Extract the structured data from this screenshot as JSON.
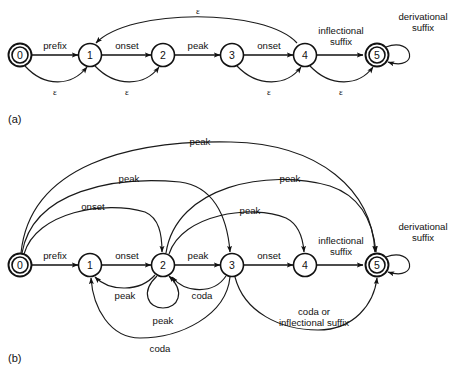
{
  "figure": {
    "type": "finite-state-automaton-diagram",
    "background_color": "#ffffff",
    "ink_color": "#111111",
    "panels": [
      {
        "id": "a",
        "caption": "(a)",
        "states": [
          {
            "id": "0",
            "label": "0",
            "accepting": true,
            "x": 20,
            "y": 55
          },
          {
            "id": "1",
            "label": "1",
            "accepting": false,
            "x": 90,
            "y": 55
          },
          {
            "id": "2",
            "label": "2",
            "accepting": false,
            "x": 163,
            "y": 55
          },
          {
            "id": "3",
            "label": "3",
            "accepting": false,
            "x": 232,
            "y": 55
          },
          {
            "id": "4",
            "label": "4",
            "accepting": false,
            "x": 305,
            "y": 55
          },
          {
            "id": "5",
            "label": "5",
            "accepting": true,
            "x": 377,
            "y": 55
          }
        ],
        "transitions": [
          {
            "from": "0",
            "to": "1",
            "label": "prefix",
            "label_x": 55,
            "label_y": 45
          },
          {
            "from": "1",
            "to": "2",
            "label": "onset",
            "label_x": 127,
            "label_y": 45
          },
          {
            "from": "2",
            "to": "3",
            "label": "peak",
            "label_x": 198,
            "label_y": 45
          },
          {
            "from": "3",
            "to": "4",
            "label": "onset",
            "label_x": 269,
            "label_y": 45
          },
          {
            "from": "4",
            "to": "5",
            "label": "inflectional suffix",
            "label_x": 341,
            "label_y": 36
          },
          {
            "from": "5",
            "to": "5",
            "label": "derivational suffix",
            "label_x": 421,
            "label_y": 22
          },
          {
            "from": "0",
            "to": "1",
            "label": "ε",
            "label_x": 55,
            "label_y": 90
          },
          {
            "from": "1",
            "to": "2",
            "label": "ε",
            "label_x": 127,
            "label_y": 90
          },
          {
            "from": "3",
            "to": "4",
            "label": "ε",
            "label_x": 269,
            "label_y": 90
          },
          {
            "from": "4",
            "to": "5",
            "label": "ε",
            "label_x": 341,
            "label_y": 90
          },
          {
            "from": "4",
            "to": "1",
            "label": "ε",
            "label_x": 198,
            "label_y": 11
          }
        ]
      },
      {
        "id": "b",
        "caption": "(b)",
        "states": [
          {
            "id": "0",
            "label": "0",
            "accepting": true,
            "x": 20,
            "y": 265
          },
          {
            "id": "1",
            "label": "1",
            "accepting": false,
            "x": 90,
            "y": 265
          },
          {
            "id": "2",
            "label": "2",
            "accepting": false,
            "x": 163,
            "y": 265
          },
          {
            "id": "3",
            "label": "3",
            "accepting": false,
            "x": 232,
            "y": 265
          },
          {
            "id": "4",
            "label": "4",
            "accepting": false,
            "x": 305,
            "y": 265
          },
          {
            "id": "5",
            "label": "5",
            "accepting": true,
            "x": 377,
            "y": 265
          }
        ],
        "transitions": [
          {
            "from": "0",
            "to": "1",
            "label": "prefix",
            "label_x": 55,
            "label_y": 255
          },
          {
            "from": "1",
            "to": "2",
            "label": "onset",
            "label_x": 127,
            "label_y": 255
          },
          {
            "from": "2",
            "to": "3",
            "label": "peak",
            "label_x": 198,
            "label_y": 255
          },
          {
            "from": "3",
            "to": "4",
            "label": "onset",
            "label_x": 269,
            "label_y": 255
          },
          {
            "from": "4",
            "to": "5",
            "label": "inflectional suffix",
            "label_x": 341,
            "label_y": 246
          },
          {
            "from": "5",
            "to": "5",
            "label": "derivational suffix",
            "label_x": 421,
            "label_y": 232
          },
          {
            "from": "0",
            "to": "2",
            "label": "onset",
            "label_x": 93,
            "label_y": 218
          },
          {
            "from": "0",
            "to": "3",
            "label": "peak",
            "label_x": 127,
            "label_y": 190
          },
          {
            "from": "0",
            "to": "5",
            "label": "peak",
            "label_x": 198,
            "label_y": 148
          },
          {
            "from": "2",
            "to": "5",
            "label": "peak",
            "label_x": 289,
            "label_y": 190
          },
          {
            "from": "2",
            "to": "4",
            "label": "peak",
            "label_x": 249,
            "label_y": 218
          },
          {
            "from": "2",
            "to": "2",
            "label": "peak",
            "label_x": 163,
            "label_y": 311
          },
          {
            "from": "2",
            "to": "1",
            "label": "peak",
            "label_x": 126,
            "label_y": 294
          },
          {
            "from": "3",
            "to": "2",
            "label": "coda",
            "label_x": 200,
            "label_y": 294
          },
          {
            "from": "3",
            "to": "1",
            "label": "coda",
            "label_x": 163,
            "label_y": 325
          },
          {
            "from": "3",
            "to": "5",
            "label": "coda or inflectional suffix",
            "label_x": 314,
            "label_y": 316
          }
        ]
      }
    ]
  }
}
